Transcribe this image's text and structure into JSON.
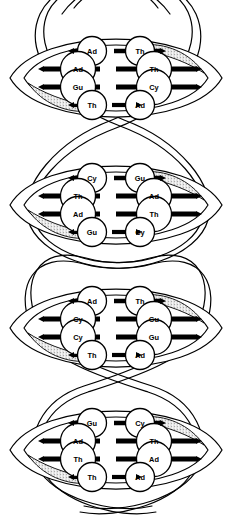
{
  "figure": {
    "base_names": {
      "Ad": "Adenine",
      "Th": "Thymine",
      "Gu": "Guanine",
      "Cy": "Cytosine"
    },
    "colors": {
      "outline": "#000000",
      "circle_fill": "#ffffff",
      "rung": "#000000",
      "stipple": "#8a8a8a",
      "background": "#ffffff"
    }
  },
  "helix": {
    "turns": [
      {
        "index": 1,
        "center_y": 78,
        "pairs": [
          {
            "row": 1,
            "left": "Ad",
            "right": "Th"
          },
          {
            "row": 2,
            "left": "Ad",
            "right": "Th"
          },
          {
            "row": 3,
            "left": "Gu",
            "right": "Cy"
          },
          {
            "row": 4,
            "left": "Th",
            "right": "Ad"
          }
        ]
      },
      {
        "index": 2,
        "center_y": 205,
        "pairs": [
          {
            "row": 1,
            "left": "Cy",
            "right": "Gu"
          },
          {
            "row": 2,
            "left": "Th",
            "right": "Ad"
          },
          {
            "row": 3,
            "left": "Ad",
            "right": "Th"
          },
          {
            "row": 4,
            "left": "Gu",
            "right": "Cy"
          }
        ]
      },
      {
        "index": 3,
        "center_y": 328,
        "pairs": [
          {
            "row": 1,
            "left": "Ad",
            "right": "Th"
          },
          {
            "row": 2,
            "left": "Cy",
            "right": "Gu"
          },
          {
            "row": 3,
            "left": "Cy",
            "right": "Gu"
          },
          {
            "row": 4,
            "left": "Th",
            "right": "Ad"
          }
        ]
      },
      {
        "index": 4,
        "center_y": 450,
        "pairs": [
          {
            "row": 1,
            "left": "Gu",
            "right": "Cy"
          },
          {
            "row": 2,
            "left": "Ad",
            "right": "Th"
          },
          {
            "row": 3,
            "left": "Th",
            "right": "Ad"
          },
          {
            "row": 4,
            "left": "Th",
            "right": "Ad"
          }
        ]
      }
    ]
  }
}
